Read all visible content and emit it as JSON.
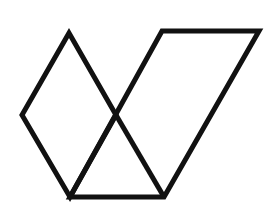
{
  "figure": {
    "stroke_color": "#111111",
    "background_color": "#ffffff",
    "stroke_width": 5,
    "shapes": [
      {
        "name": "rhombus",
        "points": "69,33 22,115 70,197 116,115"
      },
      {
        "name": "parallelogram",
        "points": "162,31 259,31 164,197 70,197"
      },
      {
        "name": "crossing-diagonal",
        "points": "116,115 164,197"
      }
    ]
  }
}
